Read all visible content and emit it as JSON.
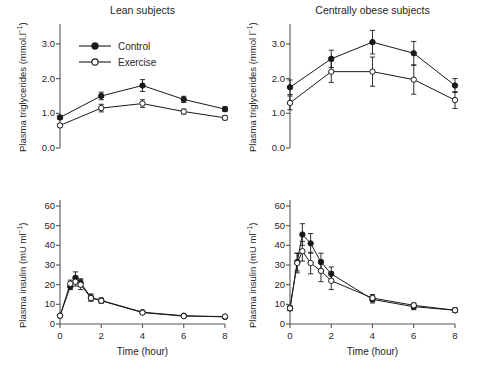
{
  "figure": {
    "background": "#ffffff",
    "series_color": "#1a1a1a"
  },
  "legend": {
    "position": "top-left-panel",
    "entries": [
      {
        "label": "Control",
        "marker": "filled-circle",
        "color": "#1a1a1a"
      },
      {
        "label": "Exercise",
        "marker": "open-circle",
        "color": "#1a1a1a"
      }
    ]
  },
  "panels": {
    "top_left": {
      "title": "Lean subjects",
      "ylabel_main": "Plasma triglycerides (mmol.l",
      "ylabel_sup": "−1",
      "ylabel_tail": ")",
      "yticks": [
        "0.0",
        "1.0",
        "2.0",
        "3.0"
      ]
    },
    "top_right": {
      "title": "Centrally obese subjects",
      "ylabel_main": "Plasma triglycerides (mmol l",
      "ylabel_sup": "−1",
      "ylabel_tail": ")",
      "yticks": [
        "0.0",
        "1.0",
        "2.0",
        "3.0"
      ]
    },
    "bottom_left": {
      "ylabel_main": "Plasma insulin (mU ml",
      "ylabel_sup": "−1",
      "ylabel_tail": ")",
      "xlabel": "Time (hour)",
      "yticks": [
        "0",
        "10",
        "20",
        "30",
        "40",
        "50",
        "60"
      ],
      "xticks": [
        "0",
        "2",
        "4",
        "6",
        "8"
      ]
    },
    "bottom_right": {
      "ylabel_main": "Plasma insulin (mU ml",
      "ylabel_sup": "−1",
      "ylabel_tail": ")",
      "xlabel": "Time (hour)",
      "yticks": [
        "0",
        "10",
        "20",
        "30",
        "40",
        "50",
        "60"
      ],
      "xticks": [
        "0",
        "2",
        "4",
        "6",
        "8"
      ]
    }
  },
  "chart_data": [
    {
      "id": "lean-triglycerides",
      "type": "line",
      "title": "Lean subjects",
      "xlabel": "",
      "ylabel": "Plasma triglycerides (mmol.l−1)",
      "xlim": [
        0,
        8
      ],
      "ylim": [
        0.0,
        3.4
      ],
      "yticks": [
        0.0,
        1.0,
        2.0,
        3.0
      ],
      "xticks": [],
      "grid": false,
      "legend": "inside-top-left",
      "x": [
        0,
        2,
        4,
        6,
        8
      ],
      "series": [
        {
          "name": "Control",
          "marker": "filled-circle",
          "values": [
            0.88,
            1.5,
            1.8,
            1.4,
            1.12
          ],
          "errors": [
            0.06,
            0.11,
            0.17,
            0.09,
            0.07
          ]
        },
        {
          "name": "Exercise",
          "marker": "open-circle",
          "values": [
            0.65,
            1.15,
            1.28,
            1.05,
            0.87
          ],
          "errors": [
            0.05,
            0.11,
            0.11,
            0.07,
            0.06
          ]
        }
      ]
    },
    {
      "id": "obese-triglycerides",
      "type": "line",
      "title": "Centrally obese subjects",
      "xlabel": "",
      "ylabel": "Plasma triglycerides (mmol l−1)",
      "xlim": [
        0,
        8
      ],
      "ylim": [
        0.0,
        3.4
      ],
      "yticks": [
        0.0,
        1.0,
        2.0,
        3.0
      ],
      "xticks": [],
      "grid": false,
      "legend": "none",
      "x": [
        0,
        2,
        4,
        6,
        8
      ],
      "series": [
        {
          "name": "Control",
          "marker": "filled-circle",
          "values": [
            1.75,
            2.57,
            3.05,
            2.73,
            1.8
          ],
          "errors": [
            0.21,
            0.25,
            0.34,
            0.34,
            0.2
          ]
        },
        {
          "name": "Exercise",
          "marker": "open-circle",
          "values": [
            1.3,
            2.2,
            2.2,
            1.97,
            1.38
          ],
          "errors": [
            0.2,
            0.31,
            0.42,
            0.42,
            0.24
          ]
        }
      ]
    },
    {
      "id": "lean-insulin",
      "type": "line",
      "title": "",
      "xlabel": "Time (hour)",
      "ylabel": "Plasma insulin (mU ml−1)",
      "xlim": [
        0,
        8
      ],
      "ylim": [
        0,
        60
      ],
      "yticks": [
        0,
        10,
        20,
        30,
        40,
        50,
        60
      ],
      "xticks": [
        0,
        2,
        4,
        6,
        8
      ],
      "grid": false,
      "legend": "none",
      "x": [
        0,
        0.5,
        0.75,
        1.0,
        1.5,
        2,
        4,
        6,
        8
      ],
      "series": [
        {
          "name": "Control",
          "marker": "filled-circle",
          "values": [
            4.2,
            19.0,
            23.5,
            21.0,
            13.5,
            12.0,
            6.0,
            4.2,
            3.6
          ],
          "errors": [
            0.5,
            1.5,
            3.0,
            2.0,
            1.8,
            1.2,
            0.7,
            0.5,
            0.4
          ]
        },
        {
          "name": "Exercise",
          "marker": "open-circle",
          "values": [
            4.2,
            20.5,
            21.5,
            20.0,
            13.2,
            11.8,
            5.8,
            4.0,
            3.8
          ],
          "errors": [
            0.5,
            1.8,
            2.2,
            2.5,
            1.5,
            1.2,
            0.7,
            0.5,
            0.5
          ]
        }
      ]
    },
    {
      "id": "obese-insulin",
      "type": "line",
      "title": "",
      "xlabel": "Time (hour)",
      "ylabel": "Plasma insulin (mU ml−1)",
      "xlim": [
        0,
        8
      ],
      "ylim": [
        0,
        60
      ],
      "yticks": [
        0,
        10,
        20,
        30,
        40,
        50,
        60
      ],
      "xticks": [
        0,
        2,
        4,
        6,
        8
      ],
      "grid": false,
      "legend": "none",
      "x": [
        0,
        0.35,
        0.6,
        1.0,
        1.5,
        2,
        4,
        6,
        8
      ],
      "series": [
        {
          "name": "Control",
          "marker": "filled-circle",
          "values": [
            8.0,
            31.5,
            45.5,
            41.0,
            31.5,
            25.5,
            12.5,
            8.8,
            7.0
          ],
          "errors": [
            1.2,
            4.5,
            5.5,
            5.0,
            4.5,
            3.5,
            1.8,
            1.5,
            1.0
          ]
        },
        {
          "name": "Exercise",
          "marker": "open-circle",
          "values": [
            8.0,
            31.0,
            37.0,
            31.0,
            27.0,
            22.0,
            13.2,
            9.5,
            7.0
          ],
          "errors": [
            1.2,
            5.0,
            5.0,
            5.5,
            5.5,
            4.5,
            1.8,
            1.2,
            1.0
          ]
        }
      ]
    }
  ]
}
